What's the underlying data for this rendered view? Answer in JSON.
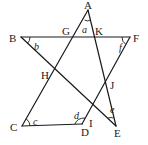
{
  "diagram": {
    "type": "geometry-star",
    "stroke_color": "#1a1a1a",
    "background": "#ffffff",
    "vertices": {
      "A": {
        "x": 88,
        "y": 10
      },
      "B": {
        "x": 21,
        "y": 37
      },
      "C": {
        "x": 22,
        "y": 126
      },
      "D": {
        "x": 82,
        "y": 124
      },
      "E": {
        "x": 116,
        "y": 126
      },
      "F": {
        "x": 130,
        "y": 37
      }
    },
    "segments": [
      {
        "name": "A-C",
        "from": "A",
        "to": "C"
      },
      {
        "name": "A-E",
        "from": "A",
        "to": "E"
      },
      {
        "name": "B-F",
        "from": "B",
        "to": "F"
      },
      {
        "name": "B-E",
        "from": "B",
        "to": "E"
      },
      {
        "name": "F-D",
        "from": "F",
        "to": "D"
      },
      {
        "name": "C-D",
        "from": "C",
        "to": "D"
      }
    ],
    "point_labels": [
      {
        "text": "A",
        "x": 84,
        "y": 9
      },
      {
        "text": "B",
        "x": 9,
        "y": 42
      },
      {
        "text": "C",
        "x": 10,
        "y": 131
      },
      {
        "text": "D",
        "x": 81,
        "y": 136
      },
      {
        "text": "E",
        "x": 114,
        "y": 137
      },
      {
        "text": "F",
        "x": 133,
        "y": 42
      },
      {
        "text": "G",
        "x": 62,
        "y": 35
      },
      {
        "text": "K",
        "x": 95,
        "y": 35
      },
      {
        "text": "H",
        "x": 41,
        "y": 79
      },
      {
        "text": "I",
        "x": 89,
        "y": 127
      },
      {
        "text": "J",
        "x": 110,
        "y": 89
      }
    ],
    "angle_labels": [
      {
        "text": "a",
        "x": 82,
        "y": 33
      },
      {
        "text": "b",
        "x": 34,
        "y": 50
      },
      {
        "text": "c",
        "x": 33,
        "y": 125
      },
      {
        "text": "d",
        "x": 74,
        "y": 119
      },
      {
        "text": "e",
        "x": 110,
        "y": 113
      },
      {
        "text": "f",
        "x": 119,
        "y": 51
      }
    ]
  }
}
